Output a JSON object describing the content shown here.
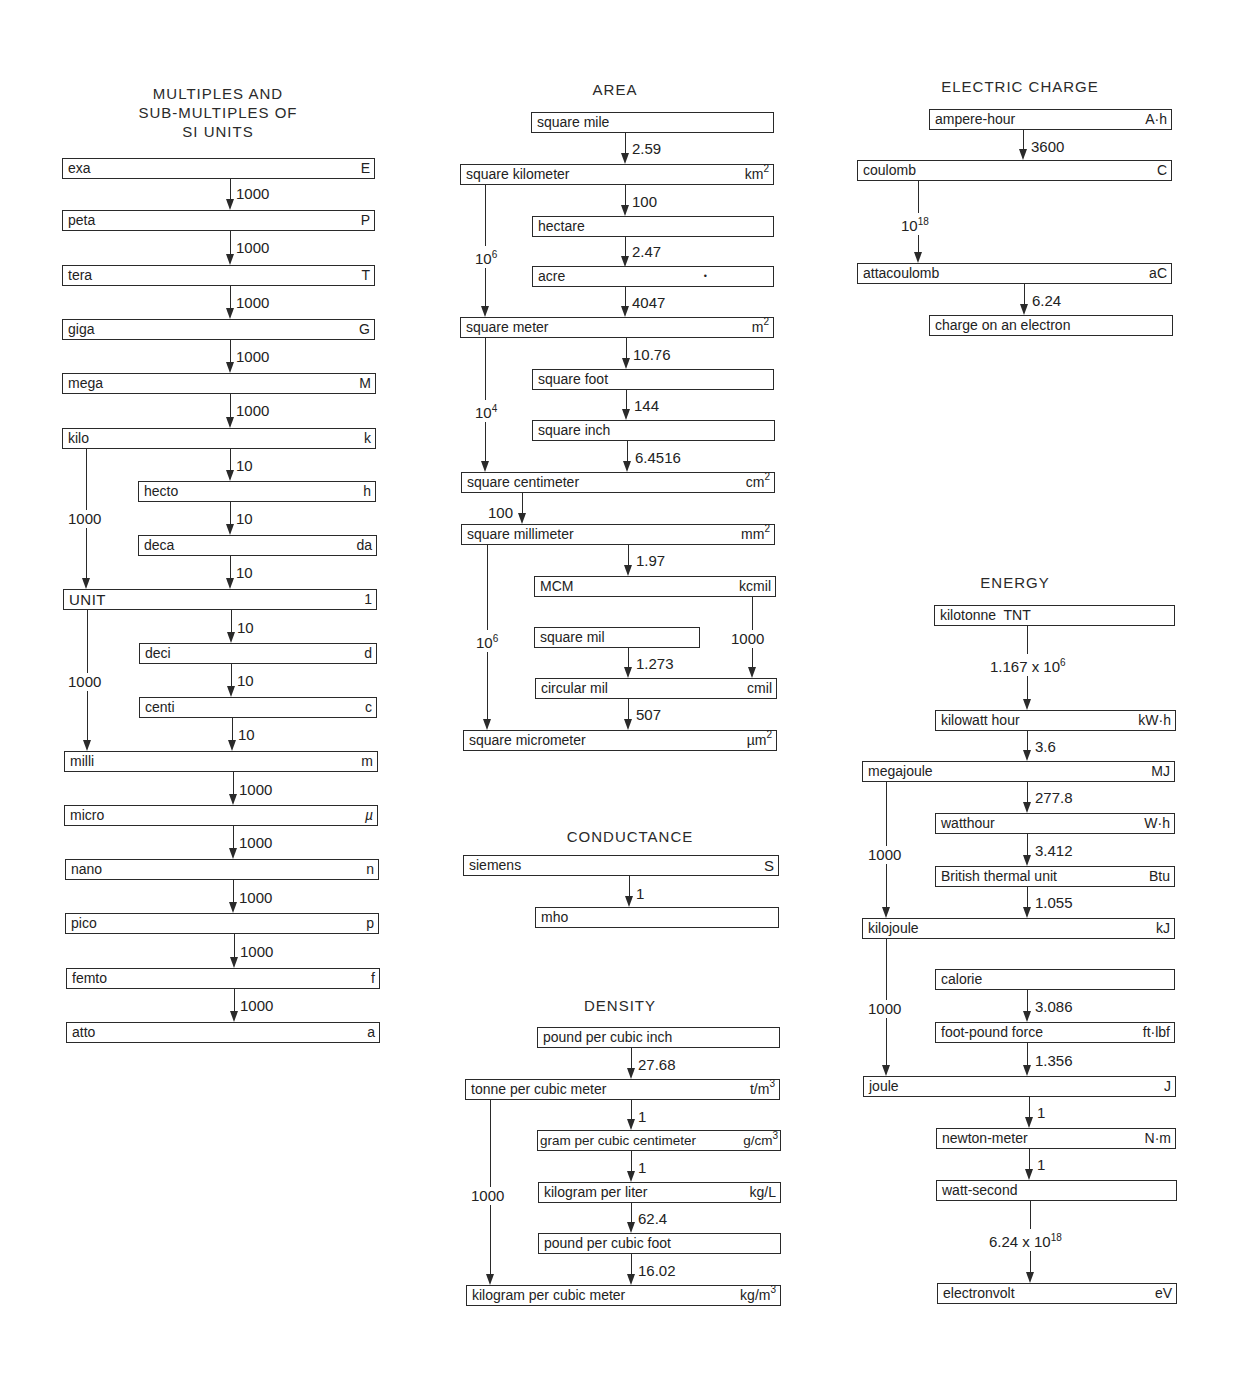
{
  "page_header": {
    "clipped": true
  },
  "sections": {
    "si": {
      "title_lines": [
        "MULTIPLES AND",
        "SUB-MULTIPLES OF",
        "SI UNITS"
      ],
      "boxes": [
        {
          "name": "exa",
          "symbol": "E"
        },
        {
          "name": "peta",
          "symbol": "P"
        },
        {
          "name": "tera",
          "symbol": "T"
        },
        {
          "name": "giga",
          "symbol": "G"
        },
        {
          "name": "mega",
          "symbol": "M"
        },
        {
          "name": "kilo",
          "symbol": "k"
        },
        {
          "name": "hecto",
          "symbol": "h"
        },
        {
          "name": "deca",
          "symbol": "da"
        },
        {
          "name": "UNIT",
          "symbol": "1"
        },
        {
          "name": "deci",
          "symbol": "d"
        },
        {
          "name": "centi",
          "symbol": "c"
        },
        {
          "name": "milli",
          "symbol": "m"
        },
        {
          "name": "micro",
          "symbol": "µ"
        },
        {
          "name": "nano",
          "symbol": "n"
        },
        {
          "name": "pico",
          "symbol": "p"
        },
        {
          "name": "femto",
          "symbol": "f"
        },
        {
          "name": "atto",
          "symbol": "a"
        }
      ],
      "factors": {
        "exa_peta": "1000",
        "peta_tera": "1000",
        "tera_giga": "1000",
        "giga_mega": "1000",
        "mega_kilo": "1000",
        "kilo_hecto": "10",
        "hecto_deca": "10",
        "deca_unit": "10",
        "kilo_unit": "1000",
        "unit_deci": "10",
        "deci_centi": "10",
        "centi_milli": "10",
        "unit_milli": "1000",
        "milli_micro": "1000",
        "micro_nano": "1000",
        "nano_pico": "1000",
        "pico_femto": "1000",
        "femto_atto": "1000"
      }
    },
    "area": {
      "title": "AREA",
      "boxes": {
        "square_mile": {
          "name": "square mile",
          "symbol": ""
        },
        "square_kilometer": {
          "name": "square kilometer",
          "symbol": "km",
          "exp": "2"
        },
        "hectare": {
          "name": "hectare",
          "symbol": ""
        },
        "acre": {
          "name": "acre",
          "symbol": "•"
        },
        "square_meter": {
          "name": "square meter",
          "symbol": "m",
          "exp": "2"
        },
        "square_foot": {
          "name": "square foot",
          "symbol": ""
        },
        "square_inch": {
          "name": "square inch",
          "symbol": ""
        },
        "square_centimeter": {
          "name": "square centimeter",
          "symbol": "cm",
          "exp": "2"
        },
        "square_millimeter": {
          "name": "square millimeter",
          "symbol": "mm",
          "exp": "2"
        },
        "mcm": {
          "name": "MCM",
          "symbol": "kcmil"
        },
        "square_mil": {
          "name": "square mil",
          "symbol": ""
        },
        "circular_mil": {
          "name": "circular mil",
          "symbol": "cmil"
        },
        "square_micrometer": {
          "name": "square micrometer",
          "symbol": "µm",
          "exp": "2"
        }
      },
      "factors": {
        "mile_km": "2.59",
        "km_hectare": "100",
        "hectare_acre": "2.47",
        "acre_m2": "4047",
        "km_m2_base": "10",
        "km_m2_exp": "6",
        "m2_ft": "10.76",
        "ft_in": "144",
        "in_cm": "6.4516",
        "m2_cm2_base": "10",
        "m2_cm2_exp": "4",
        "cm2_mm2": "100",
        "mm2_mcm": "1.97",
        "mcm_cmil": "1000",
        "smil_cmil": "1.273",
        "cmil_um2": "507",
        "mm2_um2_base": "10",
        "mm2_um2_exp": "6"
      }
    },
    "conductance": {
      "title": "CONDUCTANCE",
      "boxes": {
        "siemens": {
          "name": "siemens",
          "symbol": "S"
        },
        "mho": {
          "name": "mho",
          "symbol": ""
        }
      },
      "factors": {
        "siemens_mho": "1"
      }
    },
    "density": {
      "title": "DENSITY",
      "boxes": {
        "lb_in3": {
          "name": "pound per cubic inch",
          "symbol": ""
        },
        "t_m3": {
          "name": "tonne per cubic meter",
          "symbol": "t/m",
          "exp": "3"
        },
        "g_cm3": {
          "name": "gram per cubic centimeter",
          "symbol": "g/cm",
          "exp": "3"
        },
        "kg_l": {
          "name": "kilogram per liter",
          "symbol": "kg/L"
        },
        "lb_ft3": {
          "name": "pound per cubic foot",
          "symbol": ""
        },
        "kg_m3": {
          "name": "kilogram per cubic meter",
          "symbol": "kg/m",
          "exp": "3"
        }
      },
      "factors": {
        "lbin3_tm3": "27.68",
        "tm3_gcm3": "1",
        "gcm3_kgl": "1",
        "kgl_lbft3": "62.4",
        "lbft3_kgm3": "16.02",
        "tm3_kgm3": "1000"
      }
    },
    "electric_charge": {
      "title": "ELECTRIC CHARGE",
      "boxes": {
        "ampere_hour": {
          "name": "ampere-hour",
          "symbol": "A·h"
        },
        "coulomb": {
          "name": "coulomb",
          "symbol": "C"
        },
        "attacoulomb": {
          "name": "attacoulomb",
          "symbol": "aC"
        },
        "electron": {
          "name": "charge on an electron",
          "symbol": ""
        }
      },
      "factors": {
        "ah_c": "3600",
        "c_ac_base": "10",
        "c_ac_exp": "18",
        "ac_e": "6.24"
      }
    },
    "energy": {
      "title": "ENERGY",
      "boxes": {
        "kt_tnt": {
          "name": "kilotonne  TNT",
          "symbol": ""
        },
        "kwh": {
          "name": "kilowatt hour",
          "symbol": "kW·h"
        },
        "mj": {
          "name": "megajoule",
          "symbol": "MJ"
        },
        "wh": {
          "name": "watthour",
          "symbol": "W·h"
        },
        "btu": {
          "name": "British thermal unit",
          "symbol": "Btu"
        },
        "kj": {
          "name": "kilojoule",
          "symbol": "kJ"
        },
        "cal": {
          "name": "calorie",
          "symbol": ""
        },
        "ftlbf": {
          "name": "foot-pound force",
          "symbol": "ft·lbf"
        },
        "j": {
          "name": "joule",
          "symbol": "J"
        },
        "nm": {
          "name": "newton-meter",
          "symbol": "N·m"
        },
        "ws": {
          "name": "watt-second",
          "symbol": ""
        },
        "ev": {
          "name": "electronvolt",
          "symbol": "eV"
        }
      },
      "factors": {
        "kt_kwh_mant": "1.167 x 10",
        "kt_kwh_exp": "6",
        "kwh_mj": "3.6",
        "mj_wh": "277.8",
        "wh_btu": "3.412",
        "btu_kj": "1.055",
        "mj_kj": "1000",
        "cal_ftlbf": "3.086",
        "ftlbf_j": "1.356",
        "kj_j": "1000",
        "j_nm": "1",
        "nm_ws": "1",
        "ws_ev_mant": "6.24 x 10",
        "ws_ev_exp": "18"
      }
    }
  }
}
